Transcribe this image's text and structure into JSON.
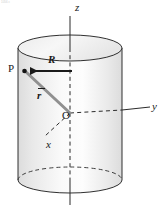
{
  "figure": {
    "kind": "physics-vector-diagram",
    "artifact_text": "1056 c",
    "labels": {
      "z_axis": "z",
      "y_axis": "y",
      "x_axis": "x",
      "point_p": "P",
      "origin": "O",
      "radius_vector": "R",
      "position_vector": "r"
    },
    "colors": {
      "stroke": "#1a1a1a",
      "cylinder_fill_left": "#e6e6e6",
      "cylinder_fill_mid": "#fbfbfb",
      "cylinder_fill_right": "#e4e4e4",
      "cap_fill": "#f2f2f2",
      "vector_r_color": "#8f8f8f",
      "arrow_R_color": "#1a1a1a"
    },
    "geometry": {
      "cylinder_left_x": 18,
      "cylinder_right_x": 122,
      "cylinder_top_y": 48,
      "cylinder_bottom_y": 180,
      "ellipse_ry": 13,
      "axis_x_center": 70,
      "origin": [
        70,
        113
      ],
      "point_p": [
        25,
        71
      ],
      "z_axis_top_y": 16,
      "z_axis_bottom_y": 205,
      "y_axis_end_x": 150,
      "x_axis_end": [
        44,
        137
      ]
    }
  }
}
